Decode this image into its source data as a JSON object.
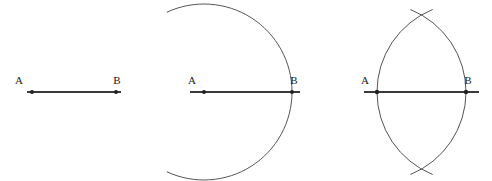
{
  "figure": {
    "background_color": "#ffffff",
    "line_color": "#3a3a3a",
    "arc_color": "#555555",
    "label_color": "#1a1a1a",
    "point_color": "#222222",
    "panels": [
      {
        "id": "panel-1",
        "name": "segment-ab",
        "caption": "",
        "labels": {
          "a": "A",
          "b": "B"
        },
        "segment": {
          "x1": 27,
          "y1": 92,
          "x2": 121,
          "y2": 92
        },
        "points": [
          {
            "name": "A",
            "x": 32,
            "y": 92
          },
          {
            "name": "B",
            "x": 116,
            "y": 92
          }
        ],
        "label_positions": [
          {
            "text": "A",
            "x": 19,
            "y": 84
          },
          {
            "text": "B",
            "x": 117,
            "y": 84
          }
        ],
        "arcs": []
      },
      {
        "id": "panel-2",
        "name": "arc-centered-at-a",
        "caption": "",
        "labels": {
          "a": "A",
          "b": "B"
        },
        "segment": {
          "x1": 190,
          "y1": 92,
          "x2": 300,
          "y2": 92
        },
        "points": [
          {
            "name": "A",
            "x": 204,
            "y": 92
          },
          {
            "name": "B",
            "x": 292,
            "y": 92
          }
        ],
        "label_positions": [
          {
            "text": "A",
            "x": 192,
            "y": 84
          },
          {
            "text": "B",
            "x": 294,
            "y": 84
          }
        ],
        "arcs": [
          {
            "name": "arc-from-a",
            "center_x": 204,
            "center_y": 92,
            "radius": 88,
            "start_angle_deg": -115,
            "end_angle_deg": 115
          }
        ]
      },
      {
        "id": "panel-3",
        "name": "two-intersecting-arcs",
        "caption": "",
        "labels": {
          "a": "A",
          "b": "B"
        },
        "segment": {
          "x1": 364,
          "y1": 92,
          "x2": 479,
          "y2": 92
        },
        "points": [
          {
            "name": "A",
            "x": 377,
            "y": 92
          },
          {
            "name": "B",
            "x": 466,
            "y": 92
          }
        ],
        "label_positions": [
          {
            "text": "A",
            "x": 365,
            "y": 84
          },
          {
            "text": "B",
            "x": 468,
            "y": 84
          }
        ],
        "arcs": [
          {
            "name": "arc-from-a",
            "center_x": 377,
            "center_y": 92,
            "radius": 89,
            "start_angle_deg": -68,
            "end_angle_deg": 68
          },
          {
            "name": "arc-from-b",
            "center_x": 466,
            "center_y": 92,
            "radius": 89,
            "start_angle_deg": 112,
            "end_angle_deg": 248
          }
        ],
        "intersections": [
          {
            "name": "upper-intersection",
            "x": 421,
            "y": 15
          },
          {
            "name": "lower-intersection",
            "x": 421,
            "y": 169
          }
        ]
      }
    ]
  }
}
